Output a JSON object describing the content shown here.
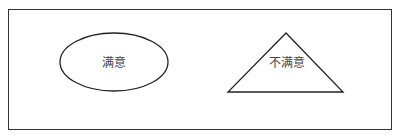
{
  "diagram": {
    "frame": {
      "x": 8,
      "y": 9,
      "width": 384,
      "height": 121,
      "stroke": "#333333"
    },
    "shapes": [
      {
        "type": "ellipse",
        "label": "满意",
        "cx": 114,
        "cy": 62,
        "rx": 54,
        "ry": 29,
        "stroke": "#222222"
      },
      {
        "type": "triangle",
        "label": "不满意",
        "points": [
          [
            286,
            33
          ],
          [
            228,
            92
          ],
          [
            343,
            92
          ]
        ],
        "label_x": 287,
        "label_y": 63,
        "stroke": "#222222"
      }
    ]
  }
}
